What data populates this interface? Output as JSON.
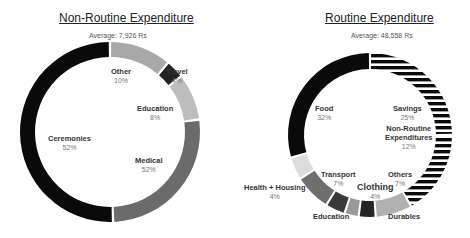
{
  "chart_data": [
    {
      "type": "pie",
      "subtype": "donut",
      "title": "Non-Routine Expenditure",
      "subtitle": "Average: 7,926 Rs",
      "categories": [
        "Other",
        "Travel",
        "Education",
        "Medical",
        "Ceremonies"
      ],
      "values": [
        10,
        4,
        8,
        52,
        52
      ],
      "value_labels": [
        "10%",
        "4%",
        "8%",
        "52%",
        "52%"
      ],
      "colors": [
        "#a8a8a8",
        "#222222",
        "#bdbdbd",
        "#6b6b6b",
        "#0a0a0a"
      ]
    },
    {
      "type": "pie",
      "subtype": "donut",
      "title": "Routine Expenditure",
      "subtitle": "Average: 48,558 Rs",
      "categories": [
        "Savings",
        "Non-Routine Expenditures",
        "Others",
        "Durables",
        "Clothing",
        "Education",
        "Transport",
        "Health + Housing",
        "Food"
      ],
      "values": [
        25,
        12,
        7,
        null,
        4,
        null,
        7,
        4,
        32
      ],
      "value_labels": [
        "25%",
        "12%",
        "7%",
        "",
        "4%",
        "",
        "7%",
        "4%",
        "32%"
      ],
      "colors": [
        "striped",
        "striped",
        "#b0b0b0",
        "#262626",
        "#9a9a9a",
        "#3a3a3a",
        "#6e6e6e",
        "#dcdcdc",
        "#0a0a0a"
      ]
    }
  ],
  "left": {
    "title": "Non-Routine Expenditure",
    "avg": "Average: 7,926 Rs",
    "labels": [
      {
        "name": "Other",
        "pct": "10%"
      },
      {
        "name": "Travel",
        "pct": "4%"
      },
      {
        "name": "Education",
        "pct": "8%"
      },
      {
        "name": "Medical",
        "pct": "52%"
      },
      {
        "name": "Ceremonies",
        "pct": "52%"
      }
    ]
  },
  "right": {
    "title": "Routine Expenditure",
    "avg": "Average: 48,558 Rs",
    "labels": [
      {
        "name": "Food",
        "pct": "32%"
      },
      {
        "name": "Savings",
        "pct": "25%"
      },
      {
        "name": "Non-Routine",
        "name2": "Expenditures",
        "pct": "12%"
      },
      {
        "name": "Others",
        "pct": "7%"
      },
      {
        "name": "Transport",
        "pct": "7%"
      },
      {
        "name": "Clothing",
        "pct": "4%"
      },
      {
        "name": "Health + Housing",
        "pct": "4%"
      },
      {
        "name": "Education"
      },
      {
        "name": "Durables"
      }
    ]
  }
}
